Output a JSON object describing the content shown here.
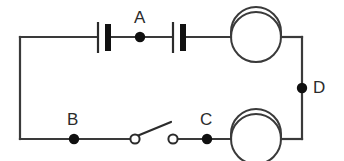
{
  "diagram": {
    "background_color": "#ffffff",
    "wire_color": "#3a3a3a",
    "label_color": "#2b2b2b",
    "width": 344,
    "height": 161
  },
  "labels": {
    "a": "A",
    "b": "B",
    "c": "C",
    "d": "D"
  },
  "components": {
    "battery_cell_1": "battery-cell",
    "battery_cell_2": "battery-cell",
    "lamp_top": "lamp",
    "lamp_bottom": "lamp",
    "switch": "open-switch",
    "node_a": "junction-dot",
    "node_b": "junction-dot",
    "node_c": "junction-dot",
    "node_d": "junction-dot"
  }
}
